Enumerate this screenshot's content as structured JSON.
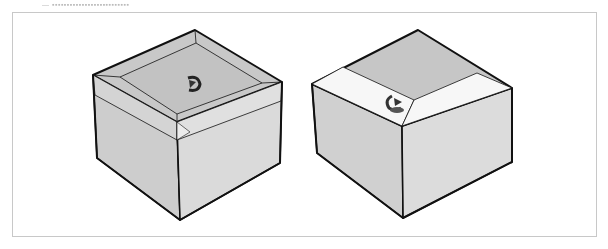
{
  "caption": "— ▪▪▪▪▪▪▪▪▪▪▪▪▪▪▪▪▪▪▪▪▪▪▪▪▪▪",
  "figure": {
    "panels": [
      {
        "label": "box-with-inset-top",
        "cursor": "orbit-cursor"
      },
      {
        "label": "box-with-highlighted-faces",
        "cursor": "orbit-cursor"
      }
    ]
  },
  "colors": {
    "face_light": "#e6e6e6",
    "face_mid": "#cfcfcf",
    "face_top": "#c4c4c4",
    "highlight": "#f8f8f8",
    "edge": "#111111",
    "frame": "#c8c8c8"
  }
}
